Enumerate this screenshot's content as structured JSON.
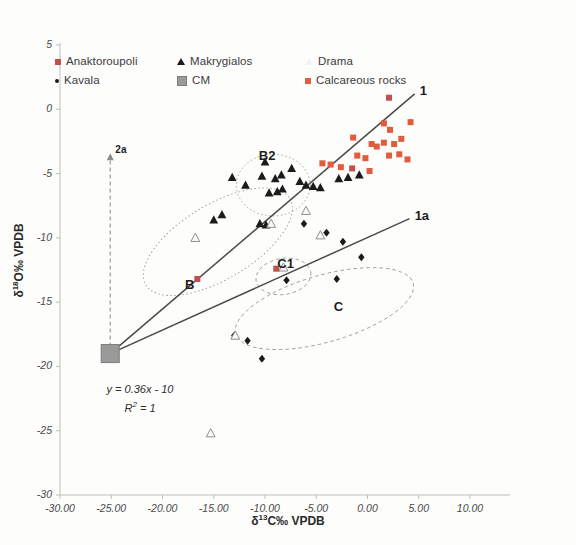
{
  "figure": {
    "background": "#fdfdfc",
    "plot_area": {
      "left": 60,
      "top": 45,
      "right": 470,
      "bottom": 495
    }
  },
  "legend": {
    "position": "top-left-inside",
    "entries": [
      {
        "label": "Anaktoroupoli",
        "marker": "square-red-icon",
        "color": "#c0504d",
        "col": 1,
        "row": 1
      },
      {
        "label": "Kavala",
        "marker": "dot-black-icon",
        "color": "#1b1b1b",
        "col": 1,
        "row": 2
      },
      {
        "label": "Makrygialos",
        "marker": "triangle-filled-icon",
        "color": "#1b1b1b",
        "col": 2,
        "row": 1
      },
      {
        "label": "CM",
        "marker": "square-gray-icon",
        "color": "#9a9a9a",
        "col": 2,
        "row": 2
      },
      {
        "label": "Drama",
        "marker": "triangle-open-icon",
        "color": "#f4f4f4",
        "col": 3,
        "row": 1
      },
      {
        "label": "Calcareous rocks",
        "marker": "square-orange-icon",
        "color": "#e05c3c",
        "col": 3,
        "row": 2
      }
    ]
  },
  "axes": {
    "x": {
      "label_prefix": "δ",
      "label_sup": "13",
      "label_suffix": "C‰ VPDB",
      "label": "δ13C‰ VPDB",
      "min": -30,
      "max": 10,
      "ticks": [
        "-30.00",
        "-25.00",
        "-20.00",
        "-15.00",
        "-10.00",
        "-5.00",
        "0.00",
        "5.00",
        "10.00"
      ],
      "tick_values": [
        -30,
        -25,
        -20,
        -15,
        -10,
        -5,
        0,
        5,
        10
      ]
    },
    "y": {
      "label_prefix": "δ",
      "label_sup": "18",
      "label_suffix": "O‰ VPDB",
      "label": "δ18O‰ VPDB",
      "min": -30,
      "max": 5,
      "ticks": [
        "5",
        "0",
        "-5",
        "-10",
        "-15",
        "-20",
        "-25",
        "-30"
      ],
      "tick_values": [
        5,
        0,
        -5,
        -10,
        -15,
        -20,
        -25,
        -30
      ]
    }
  },
  "equation": {
    "line1": "y = 0.36x - 10",
    "line2_prefix": "R",
    "line2_sup": "2",
    "line2_suffix": " = 1",
    "line2": "R² = 1"
  },
  "annotations": [
    {
      "text": "1",
      "x": 5.1,
      "y": 1.4,
      "kind": "line-end-label"
    },
    {
      "text": "1a",
      "x": 4.6,
      "y": -8.3,
      "kind": "line-end-label"
    },
    {
      "text": "2a",
      "x": -24.6,
      "y": -3.3,
      "kind": "arrow-label"
    },
    {
      "text": "B2",
      "x": -10.6,
      "y": -3.6,
      "kind": "cluster-label"
    },
    {
      "text": "B",
      "x": -17.8,
      "y": -13.7,
      "kind": "cluster-label"
    },
    {
      "text": "C1",
      "x": -8.8,
      "y": -12.0,
      "kind": "cluster-label"
    },
    {
      "text": "C",
      "x": -3.3,
      "y": -15.4,
      "kind": "cluster-label"
    }
  ],
  "chart_data": {
    "type": "scatter",
    "title": "",
    "xlabel": "δ13C‰ VPDB",
    "ylabel": "δ18O‰ VPDB",
    "xlim": [
      -30,
      10
    ],
    "ylim": [
      -30,
      5
    ],
    "grid": false,
    "legend_position": "top-left",
    "series": [
      {
        "name": "Anaktoroupoli",
        "marker": "square",
        "color": "#c0504d",
        "points": [
          [
            2.1,
            0.9
          ],
          [
            -1.5,
            -4.6
          ],
          [
            -16.6,
            -13.2
          ],
          [
            -8.9,
            -12.4
          ]
        ]
      },
      {
        "name": "Kavala",
        "marker": "diamond",
        "color": "#1b1b1b",
        "points": [
          [
            -4.0,
            -9.6
          ],
          [
            -2.4,
            -10.3
          ],
          [
            -0.6,
            -11.5
          ],
          [
            -3.0,
            -13.2
          ],
          [
            -7.9,
            -13.3
          ],
          [
            -13.0,
            -17.6
          ],
          [
            -11.7,
            -18.0
          ],
          [
            -10.3,
            -19.4
          ],
          [
            -6.2,
            -8.9
          ]
        ]
      },
      {
        "name": "Makrygialos",
        "marker": "triangle",
        "color": "#1b1b1b",
        "points": [
          [
            -11.9,
            -5.9
          ],
          [
            -10.3,
            -5.2
          ],
          [
            -9.0,
            -5.4
          ],
          [
            -8.4,
            -5.1
          ],
          [
            -8.8,
            -6.4
          ],
          [
            -9.6,
            -6.5
          ],
          [
            -8.3,
            -6.2
          ],
          [
            -10.0,
            -4.1
          ],
          [
            -13.2,
            -5.3
          ],
          [
            -7.4,
            -4.6
          ],
          [
            -6.6,
            -5.6
          ],
          [
            -6.0,
            -5.9
          ],
          [
            -5.3,
            -6.0
          ],
          [
            -4.6,
            -6.1
          ],
          [
            -15.0,
            -8.6
          ],
          [
            -14.2,
            -8.2
          ],
          [
            -10.5,
            -8.9
          ],
          [
            -9.9,
            -9.0
          ],
          [
            -0.8,
            -5.1
          ],
          [
            -1.9,
            -5.3
          ],
          [
            -2.8,
            -5.4
          ]
        ]
      },
      {
        "name": "Drama",
        "marker": "triangle-open",
        "color": "#f4f4f4",
        "points": [
          [
            -16.8,
            -10.0
          ],
          [
            -9.4,
            -8.9
          ],
          [
            -6.0,
            -7.9
          ],
          [
            -8.2,
            -12.3
          ],
          [
            -12.9,
            -17.6
          ],
          [
            -15.3,
            -25.2
          ],
          [
            -4.6,
            -9.8
          ]
        ]
      },
      {
        "name": "CM",
        "marker": "square-large",
        "color": "#9a9a9a",
        "points": [
          [
            -25.1,
            -19.0
          ]
        ]
      },
      {
        "name": "Calcareous rocks",
        "marker": "square",
        "color": "#e05c3c",
        "points": [
          [
            1.6,
            -1.1
          ],
          [
            2.2,
            -1.6
          ],
          [
            0.4,
            -2.7
          ],
          [
            0.9,
            -2.9
          ],
          [
            1.6,
            -2.6
          ],
          [
            2.6,
            -2.7
          ],
          [
            3.3,
            -2.3
          ],
          [
            2.1,
            -3.6
          ],
          [
            3.1,
            -3.5
          ],
          [
            -0.2,
            -3.8
          ],
          [
            -1.0,
            -3.6
          ],
          [
            0.2,
            -4.8
          ],
          [
            -2.6,
            -4.5
          ],
          [
            -3.6,
            -4.3
          ],
          [
            -4.4,
            -4.2
          ],
          [
            -1.4,
            -2.2
          ],
          [
            4.2,
            -1.0
          ],
          [
            3.9,
            -3.9
          ]
        ]
      }
    ],
    "trend_lines": [
      {
        "name": "1",
        "from": [
          -25.1,
          -19.0
        ],
        "to": [
          4.6,
          1.2
        ],
        "style": "solid"
      },
      {
        "name": "1a",
        "from": [
          -25.1,
          -19.0
        ],
        "to": [
          4.1,
          -8.5
        ],
        "style": "solid"
      }
    ],
    "arrow": {
      "name": "2a",
      "from": [
        -25.1,
        -19.0
      ],
      "to": [
        -25.1,
        -3.8
      ],
      "style": "dashed-vertical-up"
    },
    "ellipses": [
      {
        "name": "B2",
        "cx": -9.2,
        "cy": -5.9,
        "rx": 3.6,
        "ry": 2.4,
        "rotation": 0,
        "style": "dotted"
      },
      {
        "name": "B",
        "cx": -14.6,
        "cy": -10.3,
        "rx": 8.2,
        "ry": 2.9,
        "rotation": -31,
        "style": "dotted"
      },
      {
        "name": "C1",
        "cx": -8.2,
        "cy": -13.0,
        "rx": 2.7,
        "ry": 1.4,
        "rotation": -9,
        "style": "dashed"
      },
      {
        "name": "C",
        "cx": -4.2,
        "cy": -15.5,
        "rx": 9.0,
        "ry": 2.6,
        "rotation": -16,
        "style": "dashed"
      }
    ]
  }
}
